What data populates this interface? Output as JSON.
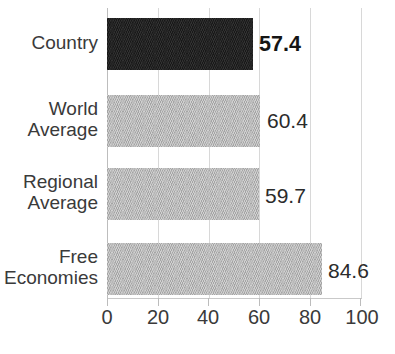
{
  "chart_data": {
    "type": "bar",
    "orientation": "horizontal",
    "title": "",
    "xlabel": "",
    "ylabel": "",
    "categories": [
      "Country",
      "World Average",
      "Regional Average",
      "Free Economies"
    ],
    "values": [
      57.4,
      60.4,
      59.7,
      84.6
    ],
    "value_labels": [
      "57.4",
      "60.4",
      "59.7",
      "84.6"
    ],
    "xlim": [
      0,
      100
    ],
    "xticks": [
      0,
      20,
      40,
      60,
      80,
      100
    ],
    "xtick_labels": [
      "0",
      "20",
      "40",
      "60",
      "80",
      "100"
    ],
    "grid": "vertical",
    "legend": "none",
    "highlight_index": 0,
    "colors": {
      "highlight_bar": "#1e1e1e",
      "bar": "#b4b4b4",
      "gridline": "#d8d8d8",
      "axis": "#c9c9c9",
      "text": "#3a3a3a",
      "background": "#ffffff"
    },
    "bars": [
      {
        "category": "Country",
        "category_lines": [
          "Country"
        ],
        "value": 57.4,
        "label": "57.4",
        "emphasis": "bold",
        "color": "#1e1e1e"
      },
      {
        "category": "World Average",
        "category_lines": [
          "World",
          "Average"
        ],
        "value": 60.4,
        "label": "60.4",
        "emphasis": "normal",
        "color": "#b4b4b4"
      },
      {
        "category": "Regional Average",
        "category_lines": [
          "Regional",
          "Average"
        ],
        "value": 59.7,
        "label": "59.7",
        "emphasis": "normal",
        "color": "#b4b4b4"
      },
      {
        "category": "Free Economies",
        "category_lines": [
          "Free",
          "Economies"
        ],
        "value": 84.6,
        "label": "84.6",
        "emphasis": "normal",
        "color": "#b4b4b4"
      }
    ]
  }
}
